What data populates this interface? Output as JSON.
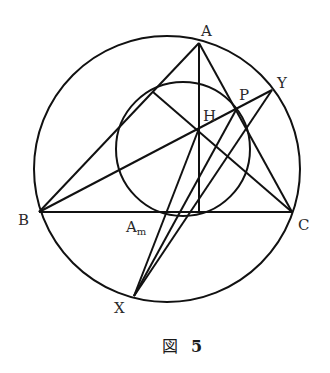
{
  "figure": {
    "caption_prefix": "図",
    "caption_number": "5",
    "stroke_color": "#111111"
  },
  "points": {
    "A": {
      "label": "A",
      "x": 199,
      "y": 43
    },
    "B": {
      "label": "B",
      "x": 39,
      "y": 212
    },
    "C": {
      "label": "C",
      "x": 292,
      "y": 212
    },
    "H": {
      "label": "H",
      "x": 198,
      "y": 131
    },
    "P": {
      "label": "P",
      "x": 236,
      "y": 110
    },
    "Y": {
      "label": "Y",
      "x": 272,
      "y": 90
    },
    "X": {
      "label": "X",
      "x": 134,
      "y": 296
    },
    "Am": {
      "label": "A",
      "subscript": "m",
      "x": 168,
      "y": 212
    },
    "D": {
      "x": 199,
      "y": 212
    },
    "F": {
      "x": 153,
      "y": 92
    }
  },
  "circles": {
    "circumcircle": {
      "cx": 167,
      "cy": 169,
      "r": 133
    },
    "nine_point_circle": {
      "cx": 183,
      "cy": 149,
      "r": 67
    }
  },
  "segments": [
    [
      "A",
      "B"
    ],
    [
      "B",
      "C"
    ],
    [
      "C",
      "A"
    ],
    [
      "A",
      "D"
    ],
    [
      "C",
      "F"
    ],
    [
      "B",
      "Y"
    ],
    [
      "X",
      "H"
    ],
    [
      "X",
      "P"
    ],
    [
      "X",
      "Y"
    ]
  ]
}
